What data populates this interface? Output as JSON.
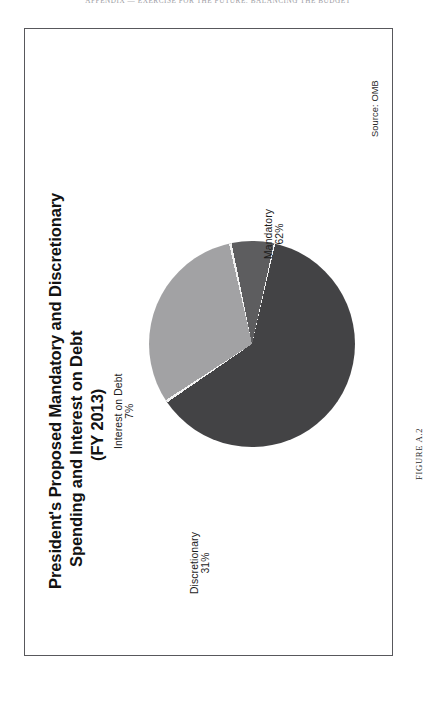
{
  "page": {
    "running_head": "APPENDIX — EXERCISE FOR THE FUTURE: BALANCING THE BUDGET",
    "figure_caption": "FIGURE A.2"
  },
  "figure": {
    "source_note": "Source: OMB",
    "title_lines": [
      "President's Proposed Mandatory and Discretionary",
      "Spending and Interest on Debt",
      "(FY 2013)"
    ]
  },
  "chart_data": {
    "type": "pie",
    "title": "President's Proposed Mandatory and Discretionary Spending and Interest on Debt (FY 2013)",
    "subtitle": "(FY 2013)",
    "source": "Source: OMB",
    "legend": "none",
    "labels_inline": true,
    "categories": [
      "Mandatory",
      "Discretionary",
      "Interest on Debt"
    ],
    "values": [
      62,
      31,
      7
    ],
    "value_suffix": "%",
    "colors": [
      "#434345",
      "#a2a2a4",
      "#5d5d5f"
    ],
    "slices": [
      {
        "name": "Mandatory",
        "value": 62,
        "display": "62%",
        "color": "#434345",
        "label_line_1": "Mandatory",
        "label_line_2": "62%"
      },
      {
        "name": "Discretionary",
        "value": 31,
        "display": "31%",
        "color": "#a2a2a4",
        "label_line_1": "Discretionary",
        "label_line_2": "31%"
      },
      {
        "name": "Interest on Debt",
        "value": 7,
        "display": "7%",
        "color": "#5d5d5f",
        "label_line_1": "Interest on Debt",
        "label_line_2": "7%"
      }
    ],
    "start_angle_deg": 0,
    "total": 100,
    "xlabel": "",
    "ylabel": ""
  }
}
